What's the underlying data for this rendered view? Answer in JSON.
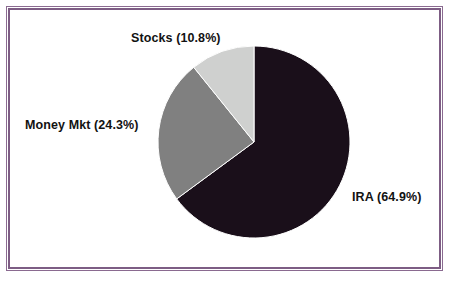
{
  "figure": {
    "background_color": "#ffffff",
    "frame_color": "#7d5d84"
  },
  "chart_data": {
    "type": "pie",
    "title": "",
    "subtitle": "",
    "xlabel": "",
    "ylabel": "",
    "grid": false,
    "legend_position": "none",
    "label_format": "{name} ({percent}%)",
    "start_angle_deg": 0,
    "direction": "clockwise",
    "categories": [
      "IRA",
      "Money Mkt",
      "Stocks"
    ],
    "values": [
      64.9,
      24.3,
      10.8
    ],
    "units": "percent",
    "total": 100.0,
    "colors": [
      "#1a0f1a",
      "#808080",
      "#cfd0cf"
    ],
    "slices": [
      {
        "name": "IRA",
        "percent": 64.9,
        "label": "IRA (64.9%)",
        "color": "#1a0f1a",
        "start_deg": 0.0,
        "end_deg": 233.64,
        "label_position": "right"
      },
      {
        "name": "Money Mkt",
        "percent": 24.3,
        "label": "Money Mkt (24.3%)",
        "color": "#808080",
        "start_deg": 233.64,
        "end_deg": 321.12,
        "label_position": "left"
      },
      {
        "name": "Stocks",
        "percent": 10.8,
        "label": "Stocks (10.8%)",
        "color": "#cfd0cf",
        "start_deg": 321.12,
        "end_deg": 360.0,
        "label_position": "top"
      }
    ],
    "annotations": []
  },
  "labels": {
    "stocks": "Stocks (10.8%)",
    "money_mkt": "Money Mkt (24.3%)",
    "ira": "IRA (64.9%)"
  }
}
